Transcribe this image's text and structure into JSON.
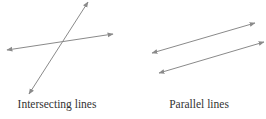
{
  "diagrams": [
    {
      "label": "Intersecting lines",
      "lines": [
        {
          "x1": 88,
          "y1": 2,
          "x2": 29,
          "y2": 94
        },
        {
          "x1": 7,
          "y1": 50,
          "x2": 113,
          "y2": 34
        }
      ]
    },
    {
      "label": "Parallel lines",
      "lines": [
        {
          "x1": 152,
          "y1": 53,
          "x2": 255,
          "y2": 23
        },
        {
          "x1": 159,
          "y1": 73,
          "x2": 264,
          "y2": 42
        }
      ]
    }
  ],
  "colors": {
    "line": "#8a8a8a",
    "text": "#333333"
  }
}
